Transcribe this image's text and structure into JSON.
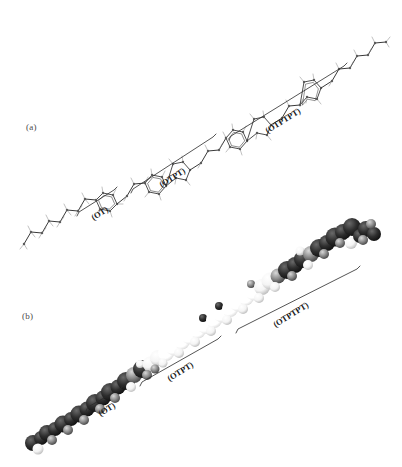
{
  "figure": {
    "background_color": "#ffffff",
    "orientation": "diagonal lower-left to upper-right",
    "panels": [
      {
        "id": "a",
        "label": "(a)",
        "label_x": 26,
        "label_y": 122,
        "representation": "ball-and-stick skeletal model",
        "description": "Line/stick molecular model of an oligomer chain with alternating alkyl zig-zag segments and hexagonal aromatic rings, with hydrogen atoms drawn as short pale spurs."
      },
      {
        "id": "b",
        "label": "(b)",
        "label_x": 22,
        "label_y": 311,
        "representation": "space-filling CPK surface model",
        "description": "Same molecule rendered as overlapping shaded spheres; dark near-black at the lower-left end, bright white through the middle, returning to dark at the upper-right end."
      }
    ],
    "segment_brackets": [
      {
        "label": "(OT)",
        "panel": "a",
        "start_x": 79,
        "start_y": 212,
        "end_x": 114,
        "end_y": 190,
        "label_x": 92,
        "label_y": 213,
        "label_rotation_deg": -32
      },
      {
        "label": "(OTPT)",
        "panel": "a",
        "start_x": 133,
        "start_y": 189,
        "end_x": 213,
        "end_y": 137,
        "label_x": 160,
        "label_y": 180,
        "label_rotation_deg": -32
      },
      {
        "label": "(OTPTPT)",
        "panel": "a",
        "start_x": 231,
        "start_y": 136,
        "end_x": 344,
        "end_y": 66,
        "label_x": 266,
        "label_y": 126,
        "label_rotation_deg": -32
      },
      {
        "label": "(OT)",
        "panel": "b",
        "start_x": 88,
        "start_y": 407,
        "end_x": 120,
        "end_y": 389,
        "label_x": 99,
        "label_y": 409,
        "label_rotation_deg": -32
      },
      {
        "label": "(OTPT)",
        "panel": "b",
        "start_x": 142,
        "start_y": 382,
        "end_x": 218,
        "end_y": 339,
        "label_x": 168,
        "label_y": 374,
        "label_rotation_deg": -32
      },
      {
        "label": "(OTPTPT)",
        "panel": "b",
        "start_x": 238,
        "start_y": 329,
        "end_x": 357,
        "end_y": 269,
        "label_x": 274,
        "label_y": 320,
        "label_rotation_deg": -32
      }
    ],
    "colors": {
      "background": "#ffffff",
      "bond_stroke": "#3a3a3a",
      "hydrogen_stroke": "#8e8e8e",
      "bracket_stroke": "#2a2a2a",
      "label_text": "#1a1a1a",
      "panel_label_text": "#4a4a4a",
      "cpk_dark": "#262626",
      "cpk_mid": "#9a9a9a",
      "cpk_light": "#f2f2f2"
    }
  }
}
